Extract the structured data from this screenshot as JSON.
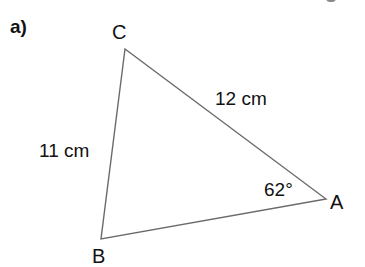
{
  "part_label": "a)",
  "triangle": {
    "vertices": [
      {
        "name": "A",
        "x": 326,
        "y": 199
      },
      {
        "name": "B",
        "x": 101,
        "y": 239
      },
      {
        "name": "C",
        "x": 125,
        "y": 49
      }
    ],
    "labels": {
      "A": "A",
      "B": "B",
      "C": "C"
    },
    "sides": {
      "AC": "12 cm",
      "BC": "11 cm"
    },
    "angle_A": "62°",
    "line_color": "#6b6b6b",
    "text_color": "#111111"
  }
}
